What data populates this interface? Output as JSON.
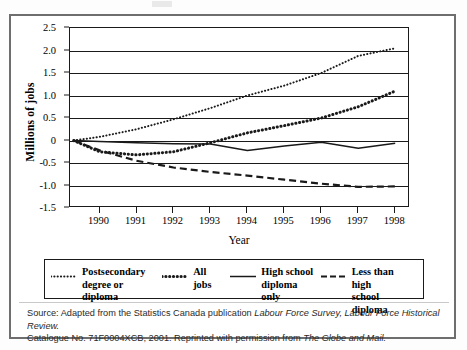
{
  "figure": {
    "axis_title_y": "Millions of jobs",
    "axis_title_x": "Year"
  },
  "source": {
    "line1_pre": "Source: Adapted from the Statistics Canada publication ",
    "line1_italic1": "Labour Force Survey, Labour Force Historical Review.",
    "line2_pre": "Catalogue No. 71F0004XCB, 2001. Reprinted with permission from ",
    "line2_italic": "The Globe and Mail.",
    "full_text": "Source: Adapted from the Statistics Canada publication Labour Force Survey, Labour Force Historical Review. Catalogue No. 71F0004XCB, 2001. Reprinted with permission from The Globe and Mail."
  },
  "legend": {
    "items": [
      {
        "label": "Postsecondary\ndegree or diploma",
        "style": "fine-dotted",
        "key_name": "legend-key-postsecondary"
      },
      {
        "label": "All jobs",
        "style": "bold-dotted",
        "key_name": "legend-key-all-jobs"
      },
      {
        "label": "High school\ndiploma only",
        "style": "solid",
        "key_name": "legend-key-high-school"
      },
      {
        "label": "Less than high\nschool diploma",
        "style": "dashed",
        "key_name": "legend-key-less-than-high-school"
      }
    ]
  },
  "chart_data": {
    "type": "line",
    "title": "",
    "xlabel": "Year",
    "ylabel": "Millions of jobs",
    "xlim": [
      1989.2,
      1998.4
    ],
    "ylim": [
      -1.5,
      2.5
    ],
    "yticks": [
      2.5,
      2.0,
      1.5,
      1.0,
      0.5,
      0,
      -0.5,
      -1.0,
      -1.5
    ],
    "ytick_labels": [
      "2.5",
      "2.0",
      "1.5",
      "1.0",
      "0.5",
      "0",
      "-0.5",
      "-1.0",
      "-1.5"
    ],
    "xticks": [
      1990,
      1991,
      1992,
      1993,
      1994,
      1995,
      1996,
      1997,
      1998
    ],
    "xtick_labels": [
      "1990",
      "1991",
      "1992",
      "1993",
      "1994",
      "1995",
      "1996",
      "1997",
      "1998"
    ],
    "grid": true,
    "grid_axis": "y",
    "legend_position": "below-plot",
    "x": [
      1989.3,
      1990,
      1991,
      1992,
      1993,
      1994,
      1995,
      1996,
      1997,
      1998
    ],
    "series": [
      {
        "name": "Postsecondary degree or diploma",
        "style": "fine-dotted",
        "color": "#1a1a1a",
        "values": [
          0.0,
          0.08,
          0.25,
          0.47,
          0.72,
          1.0,
          1.22,
          1.5,
          1.88,
          2.05
        ]
      },
      {
        "name": "All jobs",
        "style": "bold-dotted",
        "color": "#1a1a1a",
        "values": [
          0.0,
          -0.25,
          -0.32,
          -0.25,
          -0.05,
          0.17,
          0.33,
          0.5,
          0.75,
          1.1
        ]
      },
      {
        "name": "High school diploma only",
        "style": "solid",
        "color": "#1a1a1a",
        "values": [
          0.0,
          -0.02,
          -0.05,
          -0.07,
          -0.08,
          -0.22,
          -0.12,
          -0.04,
          -0.17,
          -0.06
        ]
      },
      {
        "name": "Less than high school diploma",
        "style": "dashed",
        "color": "#1a1a1a",
        "values": [
          0.0,
          -0.22,
          -0.45,
          -0.6,
          -0.7,
          -0.78,
          -0.87,
          -0.96,
          -1.03,
          -1.02
        ]
      }
    ]
  }
}
